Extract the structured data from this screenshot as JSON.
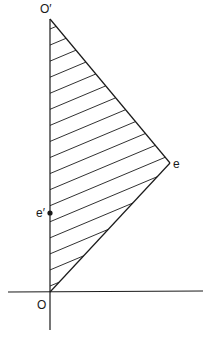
{
  "diagram": {
    "labels": {
      "o_prime": "O′",
      "e": "e",
      "e_prime": "e′",
      "o": "O"
    },
    "colors": {
      "line": "#1a1a1a",
      "background": "#ffffff"
    },
    "points": {
      "O": [
        50,
        292
      ],
      "O_prime": [
        50,
        19
      ],
      "e": [
        170,
        163
      ],
      "e_prime": [
        50,
        213
      ]
    },
    "hatch_line_count": 17
  }
}
